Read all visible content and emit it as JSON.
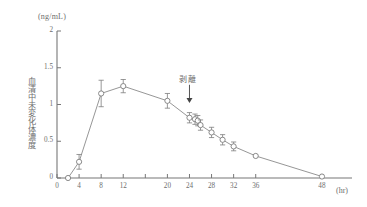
{
  "chart_data": {
    "type": "line",
    "title": "",
    "subtitle": "",
    "xlabel": "(hr)",
    "ylabel": "血清中未変化体濃度",
    "y_unit": "(ng/mL)",
    "xlim": [
      0,
      50
    ],
    "ylim": [
      0,
      2
    ],
    "grid": false,
    "legend": null,
    "x_ticks": [
      0,
      4,
      8,
      12,
      16,
      20,
      24,
      28,
      32,
      36,
      48
    ],
    "x_tick_labels": [
      "0",
      "4",
      "8",
      "12",
      "",
      "20",
      "24",
      "28",
      "32",
      "36",
      "48"
    ],
    "y_ticks": [
      0,
      0.5,
      1,
      1.5,
      2
    ],
    "y_tick_labels": [
      "0",
      "0.5",
      "1",
      "1.5",
      "2"
    ],
    "marker": "open-circle",
    "error_bars": "SD",
    "annotations": [
      {
        "text": "剥離",
        "x": 24,
        "y": 1.35,
        "arrow": "down",
        "arrow_target_y": 1.02
      }
    ],
    "series": [
      {
        "name": "血清中未変化体濃度",
        "x": [
          2,
          4,
          8,
          12,
          20,
          24,
          25,
          25.5,
          26,
          28,
          30,
          32,
          36,
          48
        ],
        "values": [
          0.0,
          0.22,
          1.15,
          1.25,
          1.05,
          0.82,
          0.8,
          0.78,
          0.72,
          0.62,
          0.52,
          0.43,
          0.3,
          0.02
        ],
        "errors": [
          0.0,
          0.1,
          0.18,
          0.09,
          0.1,
          0.07,
          0.07,
          0.07,
          0.07,
          0.07,
          0.07,
          0.06,
          0.0,
          0.0
        ]
      }
    ]
  },
  "axis": {
    "x_unit_label": "(hr)",
    "y_unit_label": "(ng/mL)"
  },
  "colors": {
    "line": "#8a8a8a",
    "marker_stroke": "#7d7d7d",
    "axis": "#777777",
    "text": "#6e6e6e"
  }
}
